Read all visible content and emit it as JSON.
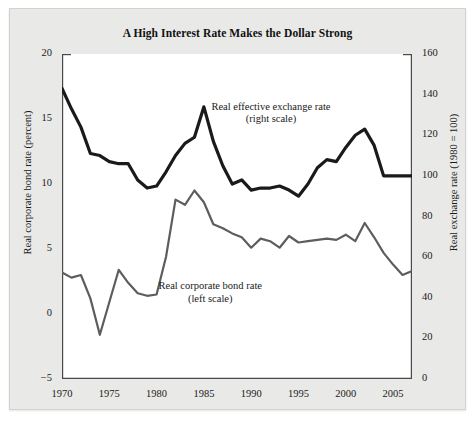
{
  "figure": {
    "title": "A High Interest Rate Makes the Dollar Strong",
    "background_color": "#e9e9e7",
    "plot_background_color": "#ffffff"
  },
  "annotations": {
    "exchange": {
      "line1": "Real effective exchange rate",
      "line2": "(right scale)"
    },
    "bond": {
      "line1": "Real corporate bond rate",
      "line2": "(left scale)"
    }
  },
  "chart_data": {
    "type": "line",
    "title": "A High Interest Rate Makes the Dollar Strong",
    "xlabel": "",
    "ylabel": "Real corporate bond rate (percent)",
    "ylabel_right": "Real exchange rate (1980 = 100)",
    "xlim": [
      1970,
      2007
    ],
    "ylim": [
      -5,
      20
    ],
    "ylim_right": [
      0,
      160
    ],
    "xticks": [
      1970,
      1975,
      1980,
      1985,
      1990,
      1995,
      2000,
      2005
    ],
    "xtick_labels": [
      "1970",
      "1975",
      "1980",
      "1985",
      "1990",
      "1995",
      "2000",
      "2005"
    ],
    "xminor_step": 1,
    "yticks": [
      -5,
      0,
      5,
      10,
      15,
      20
    ],
    "ytick_labels": [
      "−5",
      "0",
      "5",
      "10",
      "15",
      "20"
    ],
    "yticks_right": [
      0,
      20,
      40,
      60,
      80,
      100,
      120,
      140,
      160
    ],
    "ytick_labels_right": [
      "0",
      "20",
      "40",
      "60",
      "80",
      "100",
      "120",
      "140",
      "160"
    ],
    "grid": false,
    "legend": "inline-annotations",
    "x": [
      1970,
      1971,
      1972,
      1973,
      1974,
      1975,
      1976,
      1977,
      1978,
      1979,
      1980,
      1981,
      1982,
      1983,
      1984,
      1985,
      1986,
      1987,
      1988,
      1989,
      1990,
      1991,
      1992,
      1993,
      1994,
      1995,
      1996,
      1997,
      1998,
      1999,
      2000,
      2001,
      2002,
      2003,
      2004,
      2005,
      2006,
      2007
    ],
    "series": [
      {
        "name": "Real effective exchange rate (right scale)",
        "axis": "right",
        "color": "#1a1a1a",
        "width": 3.2,
        "values": [
          143,
          133,
          124,
          111,
          110,
          107,
          106,
          106,
          98,
          94,
          95,
          102,
          110,
          116,
          119,
          134,
          117,
          105,
          96,
          98,
          93,
          94,
          94,
          95,
          93,
          90,
          96,
          104,
          108,
          107,
          114,
          120,
          123,
          115,
          100,
          100,
          100,
          100
        ]
      },
      {
        "name": "Real corporate bond rate (left scale)",
        "axis": "left",
        "color": "#5d5d5d",
        "width": 2.2,
        "values": [
          3.2,
          2.8,
          3.0,
          1.2,
          -1.6,
          0.9,
          3.4,
          2.4,
          1.6,
          1.4,
          1.5,
          4.4,
          8.8,
          8.4,
          9.5,
          8.6,
          6.9,
          6.6,
          6.2,
          5.9,
          5.1,
          5.8,
          5.6,
          5.1,
          6.0,
          5.5,
          5.6,
          5.7,
          5.8,
          5.7,
          6.1,
          5.6,
          7.0,
          5.9,
          4.7,
          3.8,
          3.0,
          3.3
        ]
      }
    ]
  }
}
